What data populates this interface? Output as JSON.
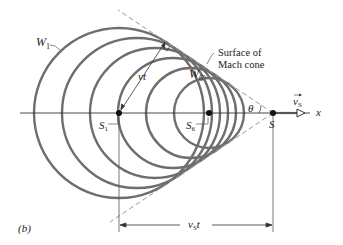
{
  "figure": {
    "panel_label": "(b)",
    "axis_label": "x",
    "labels": {
      "w1": "W",
      "w1_sub": "1",
      "w6": "W",
      "w6_sub": "6",
      "s1": "S",
      "s1_sub": "1",
      "s6": "S",
      "s6_sub": "6",
      "s": "S",
      "vt": "vt",
      "theta": "θ",
      "vs_vector": "v",
      "vs_vector_sub": "S",
      "vst": "v",
      "vst_sub": "S",
      "vst_t": "t",
      "surface_line1": "Surface of",
      "surface_line2": "Mach cone"
    },
    "colors": {
      "wavefront": "#6e6e6e",
      "lines": "#333333",
      "dashed": "#999999",
      "background": "#ffffff"
    },
    "geometry": {
      "axis_y": 113,
      "source_positions_x": [
        119,
        137,
        155,
        173,
        191,
        209
      ],
      "wavefront_radii": [
        85,
        75,
        65,
        55,
        45,
        35
      ],
      "current_source_x": 273,
      "mach_half_angle_deg": 33.5
    }
  }
}
